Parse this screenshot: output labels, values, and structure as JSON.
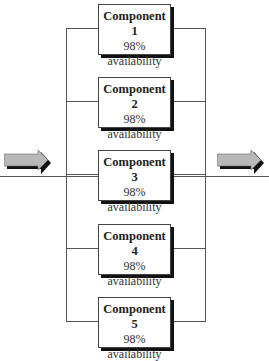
{
  "diagram": {
    "type": "parallel-redundancy",
    "components": [
      {
        "name": "Component 1",
        "value": "98%",
        "label": "availability"
      },
      {
        "name": "Component 2",
        "value": "98%",
        "label": "availability"
      },
      {
        "name": "Component 3",
        "value": "98%",
        "label": "availability"
      },
      {
        "name": "Component 4",
        "value": "98%",
        "label": "availability"
      },
      {
        "name": "Component 5",
        "value": "98%",
        "label": "availability"
      }
    ],
    "input_arrow": "right-arrow",
    "output_arrow": "right-arrow",
    "colors": {
      "arrow_fill": "#b8b8b8",
      "arrow_shadow": "#111111",
      "line": "#555555"
    }
  }
}
